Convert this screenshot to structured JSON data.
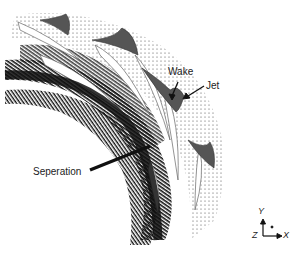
{
  "figure": {
    "colors": {
      "background": "#ffffff",
      "vectors": "#111111",
      "blade_fill": "#555555",
      "blade_outline": "#777777"
    }
  },
  "annotations": {
    "wake": "Wake",
    "jet": "Jet",
    "separation": "Seperation"
  },
  "axes": {
    "y": "Y",
    "z": "Z",
    "x": "X"
  }
}
